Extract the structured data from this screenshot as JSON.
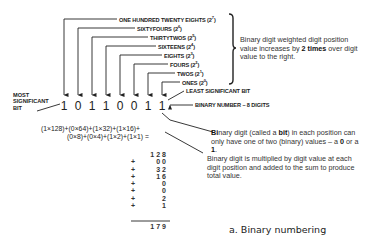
{
  "diagram": {
    "caption": "a. Binary numbering",
    "position_labels": [
      {
        "name": "ONE HUNDRED TWENTY EIGHTS",
        "exp": "7"
      },
      {
        "name": "SIXTYFOURS",
        "exp": "6"
      },
      {
        "name": "THIRTYTWOS",
        "exp": "5"
      },
      {
        "name": "SIXTEENS",
        "exp": "4"
      },
      {
        "name": "EIGHTS",
        "exp": "3"
      },
      {
        "name": "FOURS",
        "exp": "2"
      },
      {
        "name": "TWOS",
        "exp": "1"
      },
      {
        "name": "ONES",
        "exp": "0"
      }
    ],
    "most_significant_bit_label": [
      "MOST",
      "SIGNIFICANT",
      "BIT"
    ],
    "least_significant_bit_label": "LEAST SIGNIFICANT BIT",
    "binary_number_label": "BINARY NUMBER – 8 DIGITS",
    "digits": [
      "1",
      "0",
      "1",
      "1",
      "0",
      "0",
      "1",
      "1"
    ],
    "weight_note": {
      "pre": "Binary digit weighted digit position value increases by ",
      "bold": "2 times",
      "post": " over digit value to the right."
    },
    "bit_note": {
      "b1": "Bi",
      "t1": "nary digit (called a ",
      "b2": "bit",
      "t2": ") in each position can only have one of two (binary) values – a ",
      "b3": "0",
      "t3": " or a ",
      "b4": "1",
      "t4": "."
    },
    "multiply_note": "Binary digit is multiplied by digit value at each digit position and added to the sum to produce total value.",
    "formula_line1": "(1×128)+(0×64)+(1×32)+(1×16)+",
    "formula_line2": "(0×8)+(0×4)+(1×2)+(1×1) =",
    "sum_rows": [
      {
        "op": "",
        "value": "128"
      },
      {
        "op": "+",
        "value": "00"
      },
      {
        "op": "+",
        "value": "32"
      },
      {
        "op": "+",
        "value": "16"
      },
      {
        "op": "+",
        "value": "0"
      },
      {
        "op": "+",
        "value": "0"
      },
      {
        "op": "+",
        "value": "2"
      },
      {
        "op": "+",
        "value": "1"
      }
    ],
    "sum_total": "179"
  }
}
